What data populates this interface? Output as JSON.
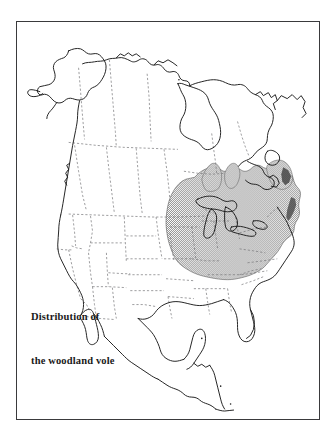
{
  "figure": {
    "kind": "range-distribution-map",
    "region": "North America",
    "frame_color": "#3a3a3c",
    "background_color": "#ffffff",
    "coastline_color": "#1a1a1a",
    "internal_border_color": "#6e6e70",
    "internal_border_style": "dashed",
    "range_shading_color": "#9a9a9a",
    "range_shading_pattern": "stipple-checkerboard",
    "range_outline_color": "#4a4a4a"
  },
  "caption": {
    "line1": "Distribution of",
    "line2": "the woodland vole",
    "full_text": "Distribution of the woodland vole"
  },
  "map_data": {
    "type": "choropleth-range",
    "title": "Distribution of the woodland vole",
    "species_common_name": "woodland vole",
    "legend": [
      {
        "label": "Distribution of the woodland vole",
        "swatch": "#9a9a9a",
        "pattern": "stipple"
      }
    ],
    "shaded_description": "Stippled gray range covering the eastern and east-central United States, from the eastern Great Plains east to the Atlantic coast, and from the lower Great Lakes south to the Gulf Coast, excluding the Florida peninsula.",
    "shaded_regions": [
      "Wisconsin (southern)",
      "Michigan (southern, Lower Peninsula)",
      "Illinois",
      "Indiana",
      "Ohio",
      "Pennsylvania",
      "New York",
      "New England (southern)",
      "New Jersey",
      "Maryland",
      "Delaware",
      "Virginia",
      "West Virginia",
      "Kentucky",
      "Tennessee",
      "North Carolina",
      "South Carolina",
      "Georgia (northern)",
      "Alabama",
      "Mississippi",
      "Arkansas",
      "Missouri",
      "Iowa (eastern)",
      "Louisiana (northern)",
      "Oklahoma (eastern)",
      "Texas (northeastern)"
    ],
    "unshaded_regions": [
      "Alaska",
      "Canada",
      "Greenland margin",
      "Western United States",
      "Florida peninsula",
      "Mexico",
      "Central America"
    ],
    "internal_boundaries": "dashed state and provincial borders"
  }
}
